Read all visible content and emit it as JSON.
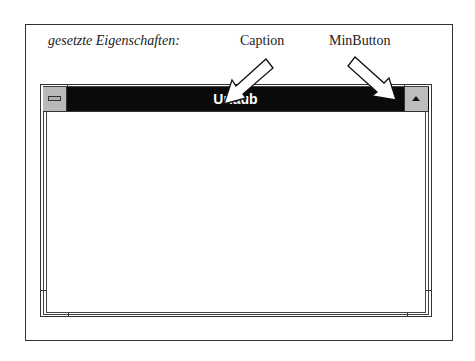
{
  "diagram": {
    "heading": "gesetzte Eigenschaften:",
    "annotations": [
      {
        "label": "Caption",
        "target": "title-bar"
      },
      {
        "label": "MinButton",
        "target": "minimize-button"
      }
    ]
  },
  "window": {
    "title": "Urlaub",
    "titlebar_color": "#0a0a0a",
    "button_color": "#bdbdbd"
  }
}
